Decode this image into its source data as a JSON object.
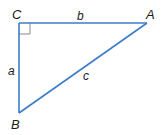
{
  "diagram": {
    "type": "right-triangle",
    "colors": {
      "line": "#3c7cc9",
      "marker": "#888888",
      "text": "#1a1a1a",
      "background": "#ffffff"
    },
    "vertices": {
      "C": {
        "label": "C",
        "x": 19,
        "y": 23
      },
      "A": {
        "label": "A",
        "x": 147,
        "y": 23
      },
      "B": {
        "label": "B",
        "x": 19,
        "y": 113
      }
    },
    "sides": {
      "a": {
        "label": "a",
        "between": [
          "C",
          "B"
        ]
      },
      "b": {
        "label": "b",
        "between": [
          "C",
          "A"
        ]
      },
      "c": {
        "label": "c",
        "between": [
          "A",
          "B"
        ]
      }
    },
    "right_angle_at": "C"
  }
}
